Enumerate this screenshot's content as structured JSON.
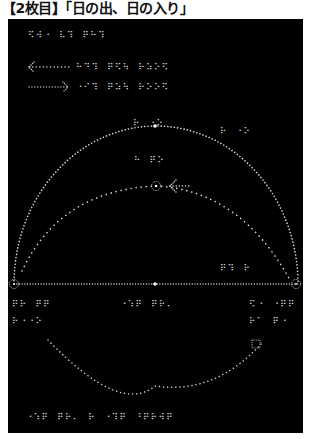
{
  "title": "【2枚目】「日の出、日の入り」",
  "colors": {
    "background": "#ffffff",
    "panel": "#000000",
    "dots": "#d8d8d8"
  },
  "braille": {
    "heading": "⠫⠺⠐⠀⠧⠹⠀⠟⠓⠹",
    "legend_sunrise_arrow_label": "⠓⠙⠹⠀⠟⠫⠳⠀⠗⠵⠕⠫",
    "legend_sunset_arrow_label": "⠐⠊⠹⠀⠟⠵⠳⠀⠗⠕⠕⠫",
    "zenith_label": "⠗⠀⠐⠕",
    "upper_right_label": "⠗⠀⠐⠕",
    "inner_arc_label": "⠓⠀⠟⠕",
    "right_arc_label": "⠟⠹⠀⠗",
    "horizon_center_label": "⠐⠱⠟⠀⠟⠗⠄",
    "left_horizon_label_1": "⠟⠗⠀⠟⠟",
    "left_horizon_label_2": "⠗⠐⠐⠕",
    "right_horizon_label_1": "⠫⠐⠀⠐⠟⠟",
    "right_horizon_label_2": "⠗⠁⠀⠟⠐",
    "footer": "⠐⠱⠟⠀⠟⠗⠄⠀⠗⠀⠐⠹⠟⠀⠘⠟⠗⠺⠟"
  },
  "legend": {
    "sunrise_arrow": "left-arrow",
    "sunset_arrow": "right-arrow"
  },
  "diagram": {
    "horizon_y": 284,
    "horizon_x1": 14,
    "horizon_x2": 298,
    "center_point": [
      155,
      284
    ],
    "zenith_point": [
      155,
      126
    ],
    "inner_sun_marker": [
      156,
      186
    ],
    "south_marker": [
      256,
      340
    ]
  }
}
